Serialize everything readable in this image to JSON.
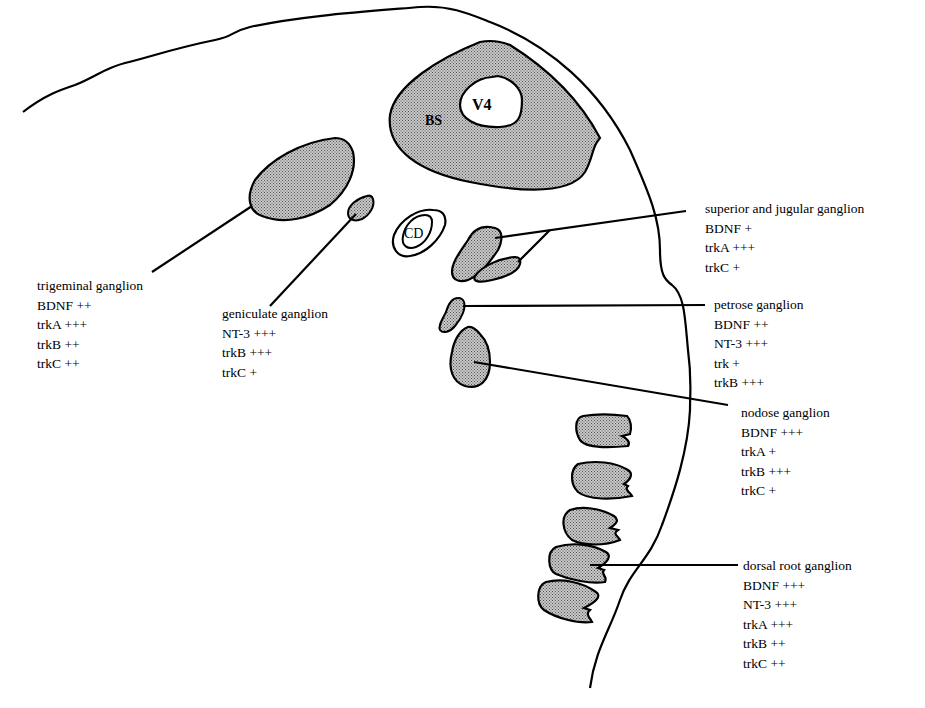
{
  "figure": {
    "structures": {
      "bs": "BS",
      "v4": "V4",
      "cd": "CD"
    },
    "colors": {
      "fill": "#b9b9b9",
      "stroke": "#000000",
      "background": "#ffffff"
    }
  },
  "ganglia": [
    {
      "name": "trigeminal ganglion",
      "markers": [
        {
          "label": "BDNF ++"
        },
        {
          "label": "trkA +++"
        },
        {
          "label": "trkB ++"
        },
        {
          "label": "trkC ++"
        }
      ]
    },
    {
      "name": "geniculate ganglion",
      "markers": [
        {
          "label": "NT-3 +++"
        },
        {
          "label": "trkB +++"
        },
        {
          "label": "trkC +"
        }
      ]
    },
    {
      "name": "superior and jugular ganglion",
      "markers": [
        {
          "label": "BDNF +"
        },
        {
          "label": "trkA +++"
        },
        {
          "label": "trkC +"
        }
      ]
    },
    {
      "name": "petrose ganglion",
      "markers": [
        {
          "label": "BDNF ++"
        },
        {
          "label": "NT-3 +++"
        },
        {
          "label": "trk +"
        },
        {
          "label": "trkB +++"
        }
      ]
    },
    {
      "name": "nodose ganglion",
      "markers": [
        {
          "label": "BDNF +++"
        },
        {
          "label": "trkA +"
        },
        {
          "label": "trkB +++"
        },
        {
          "label": "trkC +"
        }
      ]
    },
    {
      "name": "dorsal root ganglion",
      "markers": [
        {
          "label": "BDNF +++"
        },
        {
          "label": "NT-3 +++"
        },
        {
          "label": "trkA +++"
        },
        {
          "label": "trkB ++"
        },
        {
          "label": "trkC ++"
        }
      ]
    }
  ]
}
